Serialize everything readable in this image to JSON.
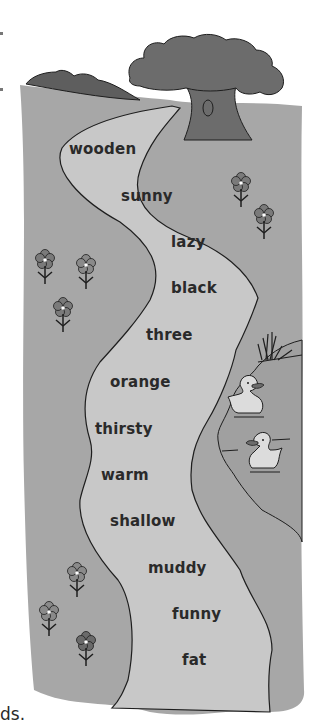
{
  "worksheet": {
    "path_words": [
      {
        "text": "wooden",
        "x": 69,
        "y": 150
      },
      {
        "text": "sunny",
        "x": 121,
        "y": 197
      },
      {
        "text": "lazy",
        "x": 171,
        "y": 243
      },
      {
        "text": "black",
        "x": 171,
        "y": 289
      },
      {
        "text": "three",
        "x": 146,
        "y": 336
      },
      {
        "text": "orange",
        "x": 110,
        "y": 383
      },
      {
        "text": "thirsty",
        "x": 95,
        "y": 430
      },
      {
        "text": "warm",
        "x": 101,
        "y": 476
      },
      {
        "text": "shallow",
        "x": 110,
        "y": 522
      },
      {
        "text": "muddy",
        "x": 148,
        "y": 569
      },
      {
        "text": "funny",
        "x": 172,
        "y": 615
      },
      {
        "text": "fat",
        "x": 182,
        "y": 661
      }
    ],
    "caption_fragment": "ds.",
    "colors": {
      "ground": "#a7a7a7",
      "path": "#c8c8c8",
      "tree_canopy": "#6c6c6c",
      "bushes": "#5e5e5e",
      "flower": "#7a7a7a",
      "duck": "#dcdcdc",
      "outline": "#1e1e1e",
      "background": "#ffffff"
    }
  }
}
